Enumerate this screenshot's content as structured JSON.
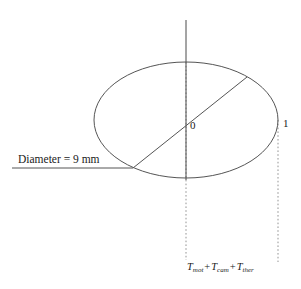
{
  "figure": {
    "colors": {
      "stroke": "#555555",
      "axis": "#4a4a4a",
      "dotted": "#777777",
      "text": "#1a1a1a",
      "background": "#ffffff"
    },
    "labels": {
      "origin": "0",
      "unit": "1",
      "diameter": "Diameter = 9 mm",
      "formula": {
        "term1_symbol": "T",
        "term1_subscript": "mot",
        "operator1": "+",
        "term2_symbol": "T",
        "term2_subscript": "cam",
        "operator2": "+",
        "term3_symbol": "T",
        "term3_subscript": "ther"
      }
    },
    "geometry": {
      "ellipse_center_x": 186,
      "ellipse_center_y": 120,
      "ellipse_radius_x": 92,
      "ellipse_radius_y": 58,
      "vertical_axis_top_y": 20,
      "vertical_axis_bottom_y": 180,
      "diagonal_start_x": 133,
      "diagonal_start_y": 168,
      "diagonal_end_x": 247,
      "diagonal_end_y": 77,
      "leader_line_start_x": 12,
      "leader_line_end_x": 133,
      "leader_line_y": 168,
      "dotted_center_x": 186,
      "dotted_right_x": 278,
      "dotted_bottom_y": 260
    }
  }
}
